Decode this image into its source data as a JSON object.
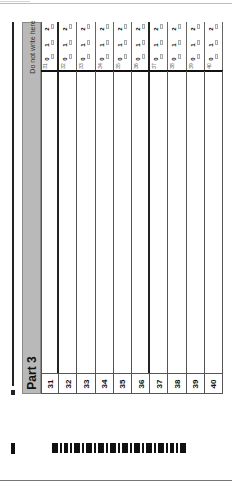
{
  "sheet": {
    "part_title": "Part 3",
    "header_note": "Do not write here",
    "score_options": [
      "0",
      "1",
      "2"
    ],
    "questions": [
      {
        "number": "31"
      },
      {
        "number": "32"
      },
      {
        "number": "33"
      },
      {
        "number": "34"
      },
      {
        "number": "35"
      },
      {
        "number": "36"
      },
      {
        "number": "37"
      },
      {
        "number": "38"
      },
      {
        "number": "39"
      },
      {
        "number": "40"
      }
    ]
  },
  "barcode": {
    "pattern": [
      3,
      1,
      2,
      1,
      3,
      1,
      3,
      1,
      3,
      1,
      3,
      1,
      3,
      1,
      3,
      1,
      3,
      1,
      3,
      1,
      2,
      1,
      3
    ]
  }
}
